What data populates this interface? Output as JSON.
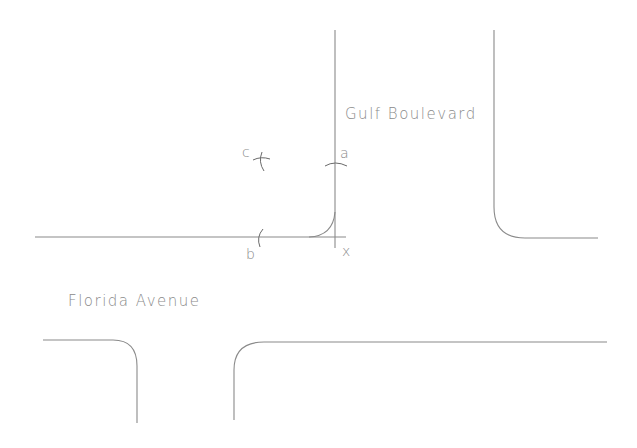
{
  "diagram": {
    "type": "street-intersection-construction",
    "streets": [
      {
        "name": "Gulf Boulevard",
        "orientation": "vertical"
      },
      {
        "name": "Florida Avenue",
        "orientation": "horizontal"
      }
    ],
    "construction_points": [
      {
        "label": "a"
      },
      {
        "label": "b"
      },
      {
        "label": "c"
      },
      {
        "label": "x"
      }
    ],
    "colors": {
      "background": "#ffffff",
      "line": "#8a8a8a",
      "label": "#8a8a8a"
    }
  }
}
